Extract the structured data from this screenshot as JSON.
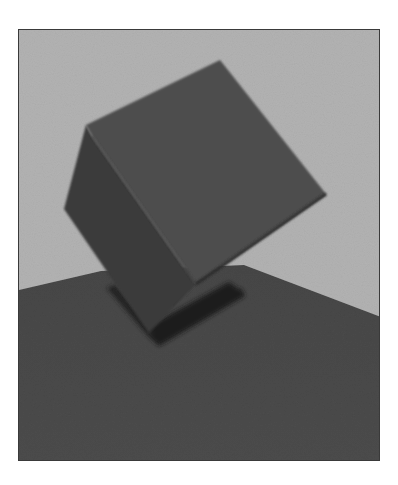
{
  "image": {
    "description": "Grayscale rendering of a tilted cube balanced on one edge above a dark ground plane, casting a shadow",
    "colors": {
      "page_background": "#ffffff",
      "frame_border": "#3a3a3a",
      "sky": "#b3b3b3",
      "ground": "#4a4a4a",
      "cube_top_face": "#4f4f4f",
      "cube_left_face": "#3b3b3b",
      "shadow": "#1c1c1c"
    },
    "frame": {
      "x": 18,
      "y": 29,
      "width": 362,
      "height": 432
    }
  }
}
